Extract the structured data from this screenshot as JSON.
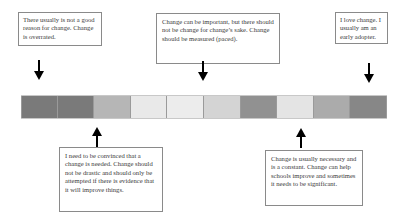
{
  "diagram": {
    "type": "continuum",
    "top_statements": [
      {
        "text": "There usually is not a good reason for change. Change is overrated."
      },
      {
        "text": "Change can be important, but there should not be change for change’s sake.  Change should be measured (paced)."
      },
      {
        "text": "I love change.  I usually am an early adopter."
      }
    ],
    "bottom_statements": [
      {
        "text": "I need to be convinced that a change is needed. Change should not be drastic and should only be attempted if there is evidence that it will improve things."
      },
      {
        "text": "Change is usually necessary and is a constant.  Change can help schools improve and sometimes it needs to be significant."
      }
    ],
    "scale": {
      "segment_count": 10,
      "segments": [
        {
          "color": "#7a7a7a"
        },
        {
          "color": "#7a7a7a"
        },
        {
          "color": "#b6b6b6"
        },
        {
          "color": "#e9e9e9"
        },
        {
          "color": "#ececec"
        },
        {
          "color": "#d4d4d4"
        },
        {
          "color": "#919191"
        },
        {
          "color": "#e4e4e4"
        },
        {
          "color": "#ababab"
        },
        {
          "color": "#878787"
        }
      ]
    },
    "arrows": [
      {
        "direction": "down",
        "target": "top_statements.0"
      },
      {
        "direction": "down",
        "target": "top_statements.1"
      },
      {
        "direction": "down",
        "target": "top_statements.2"
      },
      {
        "direction": "up",
        "target": "bottom_statements.0"
      },
      {
        "direction": "up",
        "target": "bottom_statements.1"
      }
    ]
  }
}
